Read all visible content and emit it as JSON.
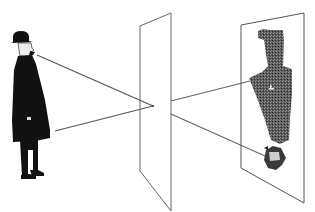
{
  "diagram": {
    "title": "Camera obscura / pinhole projection illustration",
    "elements": {
      "observer": "Man in bowler hat and long dark coat, standing",
      "pinhole_plane": "Vertical plane with pinhole aperture",
      "image_plane": "Projection plane showing inverted image of the man"
    },
    "colors": {
      "line": "#555555",
      "figure": "#111111",
      "projected_image": "#444444",
      "background": "#ffffff"
    }
  }
}
